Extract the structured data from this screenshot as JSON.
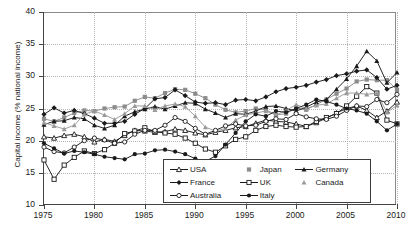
{
  "chart_data": {
    "type": "line",
    "title": "",
    "xlabel": "",
    "ylabel": "Capital income (% national income)",
    "xlim": [
      1975,
      2010
    ],
    "ylim": [
      10,
      40
    ],
    "xticks": [
      1975,
      1980,
      1985,
      1990,
      1995,
      2000,
      2005,
      2010
    ],
    "yticks": [
      10,
      15,
      20,
      25,
      30,
      35,
      40
    ],
    "grid": true,
    "legend_position": "lower-center",
    "x": [
      1975,
      1976,
      1977,
      1978,
      1979,
      1980,
      1981,
      1982,
      1983,
      1984,
      1985,
      1986,
      1987,
      1988,
      1989,
      1990,
      1991,
      1992,
      1993,
      1994,
      1995,
      1996,
      1997,
      1998,
      1999,
      2000,
      2001,
      2002,
      2003,
      2004,
      2005,
      2006,
      2007,
      2008,
      2009,
      2010
    ],
    "series": [
      {
        "name": "USA",
        "marker": "open-triangle",
        "color": "#1a1a1a",
        "values": [
          20.6,
          20.4,
          20.8,
          21.0,
          20.6,
          19.8,
          20.2,
          19.9,
          20.8,
          21.6,
          21.5,
          21.3,
          21.4,
          21.8,
          21.6,
          21.2,
          20.9,
          21.3,
          21.6,
          22.0,
          22.2,
          22.7,
          23.2,
          23.0,
          22.9,
          22.6,
          22.2,
          22.8,
          23.5,
          24.3,
          25.0,
          25.4,
          24.7,
          23.6,
          24.6,
          26.0
        ]
      },
      {
        "name": "Japan",
        "marker": "filled-square",
        "color": "#8c8c8c",
        "values": [
          23.4,
          23.0,
          23.6,
          24.3,
          24.7,
          24.6,
          25.0,
          25.2,
          25.3,
          26.2,
          26.8,
          26.6,
          27.4,
          28.0,
          27.9,
          27.3,
          26.6,
          25.6,
          24.8,
          24.4,
          24.6,
          25.0,
          24.8,
          24.0,
          24.2,
          25.1,
          24.8,
          25.6,
          26.4,
          27.3,
          28.1,
          29.2,
          29.5,
          29.4,
          29.4,
          27.9
        ]
      },
      {
        "name": "Germany",
        "marker": "filled-triangle",
        "color": "#1a1a1a",
        "values": [
          22.5,
          23.0,
          23.1,
          23.6,
          23.4,
          22.4,
          21.9,
          22.4,
          23.8,
          24.5,
          24.9,
          25.3,
          24.9,
          25.4,
          25.9,
          25.8,
          24.9,
          24.3,
          23.6,
          24.2,
          24.1,
          24.6,
          25.3,
          25.4,
          25.0,
          24.6,
          25.2,
          26.0,
          26.4,
          28.0,
          29.6,
          31.6,
          33.9,
          32.4,
          29.0,
          30.6
        ]
      },
      {
        "name": "France",
        "marker": "filled-diamond",
        "color": "#1a1a1a",
        "values": [
          24.1,
          25.1,
          24.3,
          24.7,
          24.2,
          23.5,
          22.7,
          22.7,
          23.0,
          24.1,
          25.0,
          26.5,
          26.7,
          27.9,
          27.0,
          26.0,
          25.8,
          25.9,
          25.6,
          26.3,
          26.4,
          26.2,
          26.8,
          27.6,
          28.1,
          28.3,
          28.6,
          29.1,
          29.5,
          30.1,
          30.4,
          30.8,
          31.0,
          29.8,
          28.0,
          28.6
        ]
      },
      {
        "name": "UK",
        "marker": "open-square",
        "color": "#1a1a1a",
        "values": [
          17.0,
          14.0,
          16.2,
          17.4,
          18.4,
          18.0,
          18.6,
          19.6,
          21.1,
          21.5,
          22.0,
          21.4,
          21.2,
          21.0,
          20.4,
          19.6,
          18.7,
          18.2,
          19.2,
          20.2,
          20.6,
          21.6,
          22.2,
          22.4,
          22.2,
          22.1,
          22.2,
          23.0,
          23.6,
          24.2,
          25.4,
          26.9,
          28.4,
          27.4,
          23.2,
          22.6
        ]
      },
      {
        "name": "Canada",
        "marker": "filled-triangle-gray",
        "color": "#9a9a9a",
        "values": [
          22.8,
          22.3,
          21.8,
          22.4,
          24.1,
          24.6,
          24.0,
          23.3,
          24.2,
          25.4,
          25.4,
          24.8,
          25.4,
          25.7,
          25.3,
          23.8,
          22.1,
          21.5,
          21.9,
          23.2,
          24.0,
          24.3,
          24.6,
          24.0,
          24.7,
          25.6,
          25.0,
          25.5,
          25.7,
          26.6,
          27.4,
          27.4,
          27.2,
          27.4,
          24.4,
          25.5
        ]
      },
      {
        "name": "Australia",
        "marker": "open-circle",
        "color": "#1a1a1a",
        "values": [
          19.0,
          18.3,
          18.1,
          19.0,
          20.0,
          20.4,
          20.1,
          19.6,
          19.8,
          21.0,
          21.6,
          21.6,
          22.4,
          23.6,
          23.0,
          21.9,
          21.0,
          21.6,
          22.3,
          22.6,
          22.3,
          22.4,
          23.0,
          23.4,
          23.3,
          24.2,
          23.7,
          23.4,
          23.3,
          23.8,
          24.7,
          25.4,
          25.3,
          26.4,
          25.9,
          27.2
        ]
      },
      {
        "name": "Italy",
        "marker": "filled-circle",
        "color": "#1a1a1a",
        "values": [
          19.6,
          18.8,
          18.0,
          18.4,
          18.2,
          17.9,
          17.5,
          17.3,
          17.1,
          17.9,
          18.0,
          18.5,
          18.6,
          18.3,
          17.9,
          17.2,
          16.8,
          17.6,
          19.4,
          21.2,
          23.0,
          24.1,
          23.8,
          24.6,
          24.4,
          25.0,
          25.6,
          26.4,
          26.1,
          25.6,
          25.0,
          24.7,
          24.2,
          23.0,
          21.6,
          22.6
        ]
      }
    ]
  },
  "legend": {
    "entries": [
      {
        "label": "USA",
        "marker": "open-triangle",
        "color": "#1a1a1a"
      },
      {
        "label": "Japan",
        "marker": "filled-square",
        "color": "#8c8c8c"
      },
      {
        "label": "Germany",
        "marker": "filled-triangle",
        "color": "#1a1a1a"
      },
      {
        "label": "France",
        "marker": "filled-diamond",
        "color": "#1a1a1a"
      },
      {
        "label": "UK",
        "marker": "open-square",
        "color": "#1a1a1a"
      },
      {
        "label": "Canada",
        "marker": "filled-triangle-gray",
        "color": "#9a9a9a"
      },
      {
        "label": "Australia",
        "marker": "open-circle",
        "color": "#1a1a1a"
      },
      {
        "label": "Italy",
        "marker": "filled-circle",
        "color": "#1a1a1a"
      }
    ]
  }
}
